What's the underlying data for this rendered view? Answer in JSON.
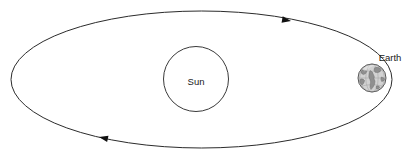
{
  "diagram": {
    "background_color": "#ffffff",
    "stroke_color": "#2b2b2b",
    "labels": {
      "sun": "Sun",
      "earth": "Earth"
    },
    "bodies": [
      {
        "name": "sun",
        "label": "Sun",
        "shape": "circle",
        "center_x": 196,
        "center_y": 79,
        "radius": 32.5,
        "fill": "#ffffff",
        "stroke": "#3a3a3a"
      },
      {
        "name": "earth",
        "label": "Earth",
        "shape": "globe",
        "center_x": 372,
        "center_y": 78,
        "radius": 14,
        "fill": "#d2d2d2",
        "land_fill": "#8f8f8f",
        "stroke": "#4a4a4a"
      }
    ],
    "orbit": {
      "name": "elliptical-orbit",
      "shape": "ellipse",
      "center_x": 201.5,
      "center_y": 79.5,
      "radius_x": 190.5,
      "radius_y": 68.5,
      "stroke": "#2b2b2b",
      "stroke_width": 1,
      "direction": "clockwise"
    },
    "direction_arrows": [
      {
        "name": "orbit-arrow-top",
        "x": 291,
        "y": 21,
        "rotation": 10,
        "points": "right",
        "fill": "#111111"
      },
      {
        "name": "orbit-arrow-bottom",
        "x": 99,
        "y": 137,
        "rotation": 192,
        "points": "left",
        "fill": "#111111"
      }
    ],
    "label_positions": {
      "sun": {
        "x": 196,
        "y": 82
      },
      "earth": {
        "x": 390,
        "y": 62
      }
    }
  }
}
